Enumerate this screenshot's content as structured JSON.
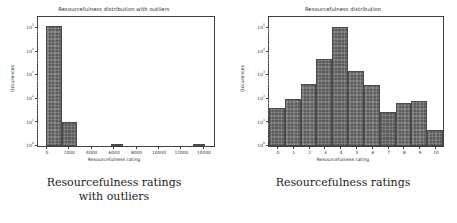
{
  "figures": [
    {
      "key": "left",
      "title": "Resourcefulness distribution with outliers",
      "caption_line1": "Resourcefulness ratings",
      "caption_line2": "with outliers",
      "xlabel": "Resourcefulness rating",
      "ylabel": "Occurences"
    },
    {
      "key": "right",
      "title": "Resourcefulness distribution",
      "caption_line1": "Resourcefulness ratings",
      "caption_line2": "",
      "xlabel": "Resourcefulness rating",
      "ylabel": "Occurences"
    }
  ],
  "chart_data": [
    {
      "type": "bar",
      "id": "resourcefulness-with-outliers",
      "title": "Resourcefulness distribution with outliers",
      "xlabel": "Resourcefulness rating",
      "ylabel": "Occurences",
      "yscale": "log",
      "ylim": [
        1,
        300000
      ],
      "xlim": [
        -700,
        15000
      ],
      "grid": false,
      "legend": null,
      "ytick_labels": [
        "10^0",
        "10^1",
        "10^2",
        "10^3",
        "10^4",
        "10^5"
      ],
      "ytick_values": [
        1,
        10,
        100,
        1000,
        10000,
        100000
      ],
      "xtick_labels": [
        "0",
        "2000",
        "4000",
        "6000",
        "8000",
        "10000",
        "12000",
        "14000"
      ],
      "xtick_values": [
        0,
        2000,
        4000,
        6000,
        8000,
        10000,
        12000,
        14000
      ],
      "bins": [
        {
          "x0": 0,
          "x1": 1400,
          "value": 120000
        },
        {
          "x0": 1400,
          "x1": 2800,
          "value": 10
        },
        {
          "x0": 5800,
          "x1": 6900,
          "value": 1
        },
        {
          "x0": 13100,
          "x1": 14200,
          "value": 1
        }
      ]
    },
    {
      "type": "bar",
      "id": "resourcefulness-distribution",
      "title": "Resourcefulness distribution",
      "xlabel": "Resourcefulness rating",
      "ylabel": "Occurences",
      "yscale": "log",
      "ylim": [
        1,
        300000
      ],
      "xlim": [
        -0.5,
        10.5
      ],
      "grid": false,
      "legend": null,
      "ytick_labels": [
        "10^0",
        "10^1",
        "10^2",
        "10^3",
        "10^4",
        "10^5"
      ],
      "ytick_values": [
        1,
        10,
        100,
        1000,
        10000,
        100000
      ],
      "xtick_labels": [
        "0",
        "1",
        "2",
        "3",
        "4",
        "5",
        "6",
        "7",
        "8",
        "9",
        "10"
      ],
      "xtick_values": [
        0,
        1,
        2,
        3,
        4,
        5,
        6,
        7,
        8,
        9,
        10
      ],
      "categories": [
        0,
        1,
        2,
        3,
        4,
        5,
        6,
        7,
        8,
        9,
        10
      ],
      "values": [
        40,
        100,
        450,
        5000,
        110000,
        1600,
        400,
        28,
        65,
        80,
        5
      ]
    }
  ],
  "colors": {
    "bar_fill": "#5c5c5c",
    "axis": "#3f3f3f",
    "text": "#262626",
    "caption": "#1a1a1a",
    "background": "#ffffff"
  }
}
